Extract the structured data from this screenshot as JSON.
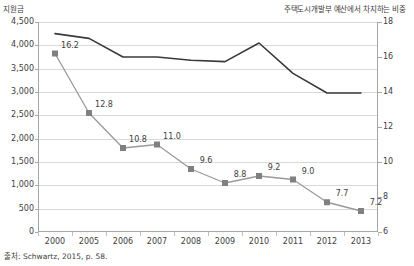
{
  "chart_data": {
    "type": "line",
    "title": "",
    "subtitle": "",
    "xlabel": "",
    "ylabel": "지원금",
    "y2label": "주택도시개발부 예산에서 차지하는 비중",
    "grid": true,
    "legend": "none",
    "categories": [
      "2000",
      "2005",
      "2006",
      "2007",
      "2008",
      "2009",
      "2010",
      "2011",
      "2012",
      "2013"
    ],
    "ylim": [
      0,
      4500
    ],
    "yticks": [
      "0",
      "500",
      "1,000",
      "1,500",
      "2,000",
      "2,500",
      "3,000",
      "3,500",
      "4,000",
      "4,500"
    ],
    "ytick_values": [
      0,
      500,
      1000,
      1500,
      2000,
      2500,
      3000,
      3500,
      4000,
      4500
    ],
    "y2lim": [
      6,
      18
    ],
    "y2ticks": [
      "6",
      "8",
      "10",
      "12",
      "14",
      "16",
      "18"
    ],
    "y2tick_values": [
      6,
      8,
      10,
      12,
      14,
      16,
      18
    ],
    "series": [
      {
        "name": "지원금",
        "axis": "left",
        "color": "#3a3a3a",
        "marker": "none",
        "labels_shown": false,
        "values": [
          4250,
          4150,
          3750,
          3750,
          3680,
          3650,
          4050,
          3400,
          2980,
          2980
        ]
      },
      {
        "name": "주택도시개발부 예산에서 차지하는 비중",
        "axis": "right",
        "color": "#9a9a9a",
        "marker": "square",
        "marker_color": "#808080",
        "labels_shown": true,
        "values": [
          16.2,
          12.8,
          10.8,
          11.0,
          9.6,
          8.8,
          9.2,
          9.0,
          7.7,
          7.2
        ],
        "value_labels": [
          "16.2",
          "12.8",
          "10.8",
          "11.0",
          "9.6",
          "8.8",
          "9.2",
          "9.0",
          "7.7",
          "7.2"
        ]
      }
    ]
  },
  "source": {
    "note": "출처: Schwartz, 2015, p. 58."
  },
  "colors": {
    "line_dark": "#3a3a3a",
    "line_gray": "#9a9a9a",
    "marker": "#808080",
    "gridline": "#d9d9d9",
    "axis": "#a6a6a6",
    "text": "#404040",
    "background": "#ffffff"
  }
}
